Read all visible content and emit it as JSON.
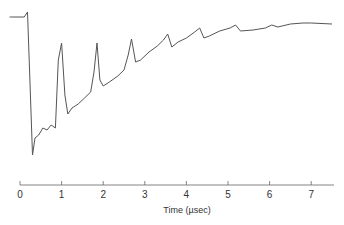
{
  "chart_data": {
    "type": "line",
    "title": "",
    "xlabel": "Time (µsec)",
    "ylabel": "",
    "xlim": [
      0,
      7.5
    ],
    "x_ticks": [
      "0",
      "1",
      "2",
      "3",
      "4",
      "5",
      "6",
      "7"
    ],
    "grid": false,
    "legend": null,
    "series": [
      {
        "name": "signal",
        "x": [
          -0.2,
          0.1,
          0.15,
          0.18,
          0.22,
          0.3,
          0.36,
          0.45,
          0.55,
          0.65,
          0.75,
          0.85,
          0.92,
          1.0,
          1.08,
          1.15,
          1.25,
          1.4,
          1.55,
          1.7,
          1.78,
          1.85,
          1.92,
          2.0,
          2.15,
          2.35,
          2.5,
          2.6,
          2.68,
          2.78,
          2.9,
          3.1,
          3.3,
          3.45,
          3.55,
          3.65,
          3.8,
          4.0,
          4.2,
          4.32,
          4.42,
          4.55,
          4.8,
          5.05,
          5.18,
          5.3,
          5.6,
          5.9,
          6.05,
          6.2,
          6.5,
          6.8,
          7.0,
          7.5
        ],
        "y_px": [
          17,
          17,
          14,
          12,
          60,
          155,
          138,
          135,
          128,
          130,
          125,
          128,
          60,
          43,
          95,
          114,
          108,
          104,
          98,
          92,
          72,
          43,
          80,
          86,
          82,
          76,
          70,
          55,
          39,
          62,
          60,
          52,
          46,
          40,
          34,
          47,
          42,
          38,
          32,
          28,
          38,
          36,
          31,
          28,
          25,
          31,
          30,
          28,
          25,
          27,
          24,
          23,
          23,
          24
        ]
      }
    ]
  },
  "axis": {
    "x_label": "Time (µsec)",
    "ticks": [
      "0",
      "1",
      "2",
      "3",
      "4",
      "5",
      "6",
      "7"
    ]
  }
}
